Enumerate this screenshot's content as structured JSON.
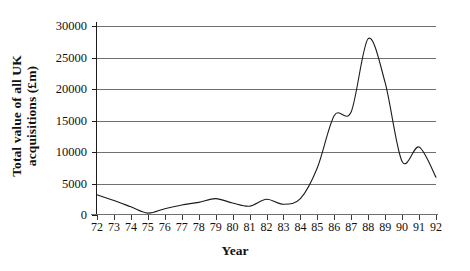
{
  "chart_data": {
    "type": "line",
    "title": "",
    "xlabel": "Year",
    "ylabel": "Total value of all UK acquisitions (£m)",
    "ylabel_lines": [
      "Total value of all UK",
      "acquisitions (£m)"
    ],
    "categories": [
      "72",
      "73",
      "74",
      "75",
      "76",
      "77",
      "78",
      "79",
      "80",
      "81",
      "82",
      "83",
      "84",
      "85",
      "86",
      "87",
      "88",
      "89",
      "90",
      "91",
      "92"
    ],
    "x": [
      72,
      73,
      74,
      75,
      76,
      77,
      78,
      79,
      80,
      81,
      82,
      83,
      84,
      85,
      86,
      87,
      88,
      89,
      90,
      91,
      92
    ],
    "values": [
      3200,
      2300,
      1300,
      300,
      1000,
      1600,
      2000,
      2600,
      1900,
      1400,
      2500,
      1700,
      2600,
      7500,
      15800,
      16400,
      28000,
      21000,
      8500,
      10800,
      6000
    ],
    "series": [
      {
        "name": "Total value of all UK acquisitions",
        "values": [
          3200,
          2300,
          1300,
          300,
          1000,
          1600,
          2000,
          2600,
          1900,
          1400,
          2500,
          1700,
          2600,
          7500,
          15800,
          16400,
          28000,
          21000,
          8500,
          10800,
          6000
        ]
      }
    ],
    "ylim": [
      0,
      30000
    ],
    "xlim": [
      72,
      92
    ],
    "ytick_labels": [
      "0",
      "5000",
      "10000",
      "15000",
      "20000",
      "25000",
      "30000"
    ],
    "ytick_values": [
      0,
      5000,
      10000,
      15000,
      20000,
      25000,
      30000
    ],
    "grid": true,
    "grid_axis": "y",
    "legend": "none",
    "line_color": "#1b1b1b",
    "grid_color": "#6f6f6f",
    "background": "#ffffff"
  }
}
